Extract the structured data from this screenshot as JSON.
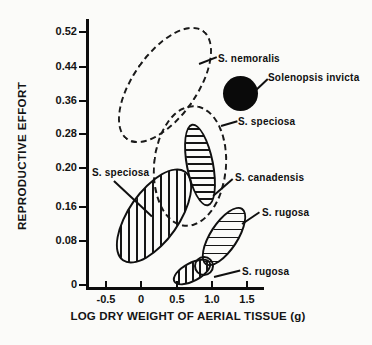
{
  "figure": {
    "background": "#fbfbf9",
    "ink": "#111111"
  },
  "chart_data": {
    "type": "scatter",
    "title": "",
    "xlabel": "LOG DRY WEIGHT OF AERIAL TISSUE (g)",
    "ylabel": "REPRODUCTIVE EFFORT",
    "grid": false,
    "legend_position": "none",
    "xlim": [
      -1.2,
      1.7
    ],
    "ylim": [
      0,
      0.56
    ],
    "x_ticks": [
      {
        "label": "-0.5",
        "px": 106
      },
      {
        "label": "0",
        "px": 141
      },
      {
        "label": "0.5",
        "px": 177
      },
      {
        "label": "1.0",
        "px": 212
      },
      {
        "label": "1.5",
        "px": 247
      }
    ],
    "y_ticks": [
      {
        "label": "0.52",
        "py": 32
      },
      {
        "label": "0.44",
        "py": 67
      },
      {
        "label": "0.36",
        "py": 101
      },
      {
        "label": "0.28",
        "py": 134
      },
      {
        "label": "0.20",
        "py": 168
      },
      {
        "label": "0.16",
        "py": 207
      },
      {
        "label": "0.08",
        "py": 241
      },
      {
        "label": "0",
        "py": 285
      }
    ],
    "ellipses": [
      {
        "id": "s-nemoralis",
        "species": "S. nemoralis",
        "stroke": "dashed",
        "hatch": "none",
        "x_range": [
          -0.32,
          1.0
        ],
        "y_range": [
          0.26,
          0.53
        ],
        "cx": 165,
        "cy": 85,
        "w": 134,
        "h": 66,
        "rot": -55
      },
      {
        "id": "s-speciosa-dashed",
        "species": "S. speciosa",
        "stroke": "dashed",
        "hatch": "none",
        "x_range": [
          0.17,
          1.21
        ],
        "y_range": [
          0.11,
          0.35
        ],
        "cx": 190,
        "cy": 166,
        "w": 122,
        "h": 74,
        "rot": -85
      },
      {
        "id": "s-speciosa-hatched",
        "species": "S. speciosa",
        "stroke": "solid",
        "hatch": "vertical",
        "x_range": [
          -0.35,
          0.72
        ],
        "y_range": [
          0.045,
          0.2
        ],
        "cx": 154,
        "cy": 216,
        "w": 110,
        "h": 52,
        "rot": -55
      },
      {
        "id": "s-canadensis",
        "species": "S. canadensis",
        "stroke": "solid",
        "hatch": "horizontal",
        "x_range": [
          0.6,
          1.06
        ],
        "y_range": [
          0.165,
          0.305
        ],
        "cx": 200,
        "cy": 165,
        "w": 84,
        "h": 28,
        "rot": 79,
        "period": 7
      },
      {
        "id": "s-rugosa-large",
        "species": "S. rugosa",
        "stroke": "solid",
        "hatch": "horizontal",
        "x_range": [
          0.83,
          1.49
        ],
        "y_range": [
          0.05,
          0.165
        ],
        "cx": 224,
        "cy": 236,
        "w": 68,
        "h": 29,
        "rot": -57,
        "period": 8
      },
      {
        "id": "s-rugosa-small",
        "species": "S. rugosa",
        "stroke": "solid",
        "hatch": "vertical",
        "x_range": [
          0.44,
          0.99
        ],
        "y_range": [
          0.005,
          0.055
        ],
        "cx": 192,
        "cy": 272,
        "w": 42,
        "h": 20,
        "rot": -28,
        "period": 7
      }
    ],
    "circles": [
      {
        "id": "solenopsis-invicta",
        "species": "Solenopsis invicta",
        "x": 1.4,
        "y": 0.38,
        "cx": 240,
        "cy": 93,
        "r": 17.5,
        "fill": "#0a0a0a",
        "stroke": "none"
      },
      {
        "id": "rugosa-overlap-circle",
        "species": "S. rugosa",
        "x": 0.89,
        "y": 0.03,
        "cx": 204,
        "cy": 266,
        "r": 10,
        "fill": "none",
        "stroke": "solid"
      }
    ],
    "labels": [
      {
        "id": "label-s-nemoralis",
        "text": "S. nemoralis",
        "x": 218,
        "y": 53
      },
      {
        "id": "label-solenopsis-invicta",
        "text": "Solenopsis invicta",
        "x": 268,
        "y": 72
      },
      {
        "id": "label-s-speciosa-dashed",
        "text": "S. speciosa",
        "x": 238,
        "y": 116
      },
      {
        "id": "label-s-speciosa-hatched",
        "text": "S. speciosa",
        "x": 92,
        "y": 167
      },
      {
        "id": "label-s-canadensis",
        "text": "S. canadensis",
        "x": 235,
        "y": 172
      },
      {
        "id": "label-s-rugosa-large",
        "text": "S. rugosa",
        "x": 262,
        "y": 207
      },
      {
        "id": "label-s-rugosa-small",
        "text": "S. rugosa",
        "x": 242,
        "y": 266
      }
    ],
    "pointers": [
      {
        "id": "ptr-s-nemoralis",
        "x": 199,
        "y": 63,
        "len": 19,
        "ang": -21
      },
      {
        "id": "ptr-solenopsis-invicta",
        "x": 256,
        "y": 89,
        "len": 16,
        "ang": -43
      },
      {
        "id": "ptr-s-speciosa-dashed",
        "x": 221,
        "y": 125,
        "len": 17,
        "ang": -16
      },
      {
        "id": "ptr-s-speciosa-hatched",
        "x": 114,
        "y": 180,
        "len": 52,
        "ang": 43
      },
      {
        "id": "ptr-s-canadensis",
        "x": 213,
        "y": 195,
        "len": 26,
        "ang": -41
      },
      {
        "id": "ptr-s-rugosa-large",
        "x": 242,
        "y": 223,
        "len": 21,
        "ang": -34
      },
      {
        "id": "ptr-s-rugosa-small",
        "x": 214,
        "y": 276,
        "len": 27,
        "ang": -14
      }
    ]
  }
}
